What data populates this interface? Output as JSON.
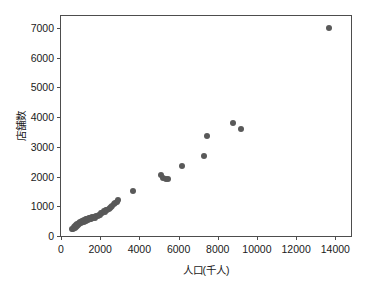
{
  "chart_data": {
    "type": "scatter",
    "title": "",
    "xlabel": "人口(千人)",
    "ylabel": "店舗数",
    "xlim": [
      0,
      14800
    ],
    "ylim": [
      0,
      7400
    ],
    "grid": false,
    "legend": null,
    "marker": {
      "color": "#595959",
      "shape": "circle",
      "size": 6
    },
    "xticks": [
      0,
      2000,
      4000,
      6000,
      8000,
      10000,
      12000,
      14000
    ],
    "xtick_labels": [
      "0",
      "2000",
      "4000",
      "6000",
      "8000",
      "10000",
      "12000",
      "14000"
    ],
    "yticks": [
      0,
      1000,
      2000,
      3000,
      4000,
      5000,
      6000,
      7000
    ],
    "ytick_labels": [
      "0",
      "1000",
      "2000",
      "3000",
      "4000",
      "5000",
      "6000",
      "7000"
    ],
    "points": [
      [
        560,
        230
      ],
      [
        600,
        250
      ],
      [
        640,
        270
      ],
      [
        680,
        300
      ],
      [
        700,
        265
      ],
      [
        720,
        330
      ],
      [
        760,
        300
      ],
      [
        790,
        360
      ],
      [
        810,
        340
      ],
      [
        830,
        400
      ],
      [
        860,
        380
      ],
      [
        900,
        430
      ],
      [
        940,
        400
      ],
      [
        980,
        470
      ],
      [
        1010,
        450
      ],
      [
        1050,
        500
      ],
      [
        1080,
        470
      ],
      [
        1120,
        520
      ],
      [
        1150,
        480
      ],
      [
        1180,
        540
      ],
      [
        1220,
        500
      ],
      [
        1260,
        560
      ],
      [
        1300,
        520
      ],
      [
        1340,
        575
      ],
      [
        1380,
        540
      ],
      [
        1420,
        590
      ],
      [
        1460,
        560
      ],
      [
        1500,
        610
      ],
      [
        1550,
        580
      ],
      [
        1600,
        630
      ],
      [
        1650,
        600
      ],
      [
        1700,
        650
      ],
      [
        1760,
        620
      ],
      [
        1810,
        680
      ],
      [
        1870,
        660
      ],
      [
        1930,
        720
      ],
      [
        1990,
        700
      ],
      [
        2050,
        760
      ],
      [
        2110,
        790
      ],
      [
        2170,
        830
      ],
      [
        2230,
        810
      ],
      [
        2300,
        880
      ],
      [
        2370,
        860
      ],
      [
        2430,
        920
      ],
      [
        2500,
        950
      ],
      [
        2560,
        990
      ],
      [
        2620,
        1020
      ],
      [
        2700,
        1060
      ],
      [
        2780,
        1100
      ],
      [
        2860,
        1150
      ],
      [
        2900,
        1200
      ],
      [
        3650,
        1510
      ],
      [
        5100,
        2060
      ],
      [
        5200,
        1960
      ],
      [
        5350,
        1930
      ],
      [
        5450,
        1930
      ],
      [
        6200,
        2370
      ],
      [
        7300,
        2700
      ],
      [
        7450,
        3350
      ],
      [
        8800,
        3790
      ],
      [
        9200,
        3590
      ],
      [
        13700,
        6980
      ]
    ]
  }
}
